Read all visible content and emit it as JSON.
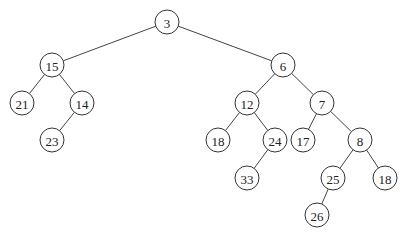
{
  "diagram": {
    "type": "binary-tree",
    "nodes": [
      {
        "id": "n3",
        "label": "3"
      },
      {
        "id": "n15",
        "label": "15"
      },
      {
        "id": "n6",
        "label": "6"
      },
      {
        "id": "n21",
        "label": "21"
      },
      {
        "id": "n14",
        "label": "14"
      },
      {
        "id": "n23",
        "label": "23"
      },
      {
        "id": "n12",
        "label": "12"
      },
      {
        "id": "n7",
        "label": "7"
      },
      {
        "id": "n18a",
        "label": "18"
      },
      {
        "id": "n24",
        "label": "24"
      },
      {
        "id": "n17",
        "label": "17"
      },
      {
        "id": "n8",
        "label": "8"
      },
      {
        "id": "n33",
        "label": "33"
      },
      {
        "id": "n25",
        "label": "25"
      },
      {
        "id": "n18b",
        "label": "18"
      },
      {
        "id": "n26",
        "label": "26"
      }
    ],
    "edges": [
      {
        "from": "n3",
        "to": "n15"
      },
      {
        "from": "n3",
        "to": "n6"
      },
      {
        "from": "n15",
        "to": "n21"
      },
      {
        "from": "n15",
        "to": "n14"
      },
      {
        "from": "n14",
        "to": "n23"
      },
      {
        "from": "n6",
        "to": "n12"
      },
      {
        "from": "n6",
        "to": "n7"
      },
      {
        "from": "n12",
        "to": "n18a"
      },
      {
        "from": "n12",
        "to": "n24"
      },
      {
        "from": "n24",
        "to": "n33"
      },
      {
        "from": "n7",
        "to": "n17"
      },
      {
        "from": "n7",
        "to": "n8"
      },
      {
        "from": "n8",
        "to": "n25"
      },
      {
        "from": "n8",
        "to": "n18b"
      },
      {
        "from": "n25",
        "to": "n26"
      }
    ]
  }
}
